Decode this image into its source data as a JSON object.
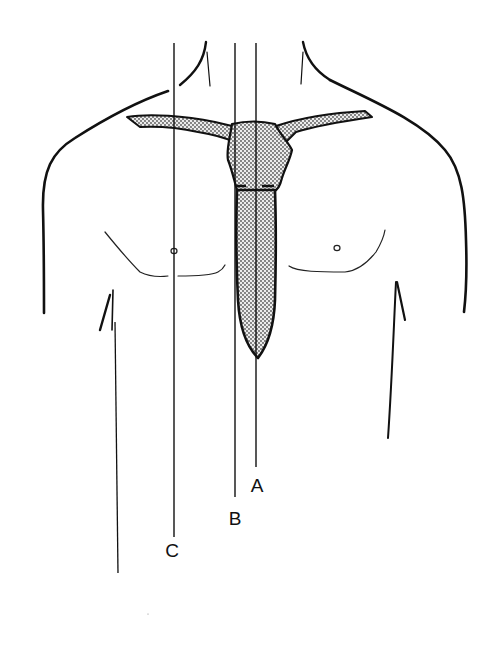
{
  "figure": {
    "colors": {
      "ink": "#111111",
      "bone_fill": "#d9d9d9",
      "stipple": "#555555",
      "background": "#ffffff"
    }
  },
  "labels": {
    "A": "A",
    "B": "B",
    "C": "C"
  },
  "reference_lines": [
    {
      "id": "A",
      "x": 256,
      "y_top": 43,
      "y_bottom": 467,
      "label_pos": [
        257,
        476
      ]
    },
    {
      "id": "B",
      "x": 235,
      "y_top": 43,
      "y_bottom": 497,
      "label_pos": [
        235,
        509
      ]
    },
    {
      "id": "C",
      "x": 174,
      "y_top": 43,
      "y_bottom": 537,
      "label_pos": [
        172,
        541
      ]
    }
  ],
  "structures": [
    "neck",
    "shoulders",
    "clavicles",
    "manubrium",
    "sternal-body",
    "nipples",
    "pectoral-folds",
    "arms"
  ]
}
